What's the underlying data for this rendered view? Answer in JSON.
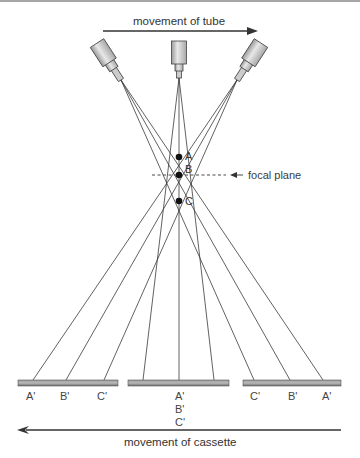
{
  "diagram": {
    "top_arrow_label": "movement of tube",
    "bottom_arrow_label": "movement of cassette",
    "focal_plane_label": "focal plane",
    "points": [
      {
        "label": "A",
        "x": 179,
        "y": 157
      },
      {
        "label": "B",
        "x": 179,
        "y": 175
      },
      {
        "label": "C",
        "x": 179,
        "y": 201
      }
    ],
    "tubes": [
      {
        "name": "left",
        "position": "left"
      },
      {
        "name": "center",
        "position": "center"
      },
      {
        "name": "right",
        "position": "right"
      }
    ],
    "cassettes": [
      {
        "name": "left",
        "labels": [
          "A'",
          "B'",
          "C'"
        ]
      },
      {
        "name": "center",
        "labels": [
          "A'",
          "B'",
          "C'"
        ]
      },
      {
        "name": "right",
        "labels": [
          "C'",
          "B'",
          "A'"
        ]
      }
    ],
    "colors": {
      "line": "#3a3a3a",
      "cassette": "#8a8a8a",
      "tube": "#c8c8c8"
    }
  }
}
